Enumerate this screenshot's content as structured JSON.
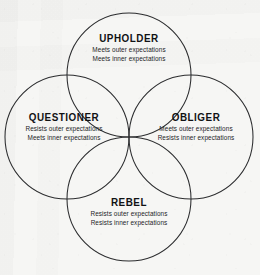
{
  "diagram": {
    "shape": "four-overlapping-circles",
    "stroke_color": "#2b2c2e",
    "background_color": "#f6f6f4",
    "text_color": "#17181a",
    "quadrants": [
      {
        "id": "upholder",
        "position": "top",
        "title": "UPHOLDER",
        "line1": "Meets outer expectations",
        "line2": "Meets inner expectations"
      },
      {
        "id": "questioner",
        "position": "left",
        "title": "QUESTIONER",
        "line1": "Resists outer expectations",
        "line2": "Meets inner expectations"
      },
      {
        "id": "obliger",
        "position": "right",
        "title": "OBLIGER",
        "line1": "Meets outer expectations",
        "line2": "Resists inner expectations"
      },
      {
        "id": "rebel",
        "position": "bottom",
        "title": "REBEL",
        "line1": "Resists outer expectations",
        "line2": "Resists inner expectations"
      }
    ],
    "geometry": {
      "radius": 62,
      "intersection_x": 129,
      "intersection_y": 137,
      "circles": [
        {
          "id": "circle-upholder",
          "cx": 129,
          "cy": 75
        },
        {
          "id": "circle-questioner",
          "cx": 67,
          "cy": 137
        },
        {
          "id": "circle-obliger",
          "cx": 191,
          "cy": 137
        },
        {
          "id": "circle-rebel",
          "cx": 129,
          "cy": 199
        }
      ]
    }
  }
}
